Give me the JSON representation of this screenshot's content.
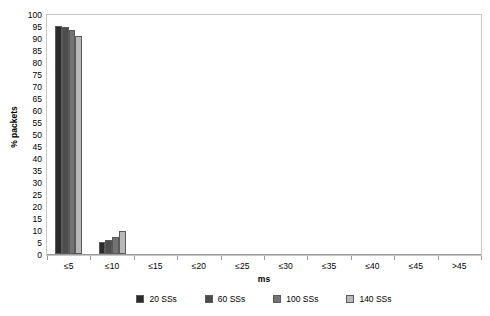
{
  "chart_data": {
    "type": "bar",
    "title": "",
    "xlabel": "ms",
    "ylabel": "% packets",
    "ylim": [
      0,
      100
    ],
    "ytick_step": 5,
    "yticks": [
      100,
      95,
      90,
      85,
      80,
      75,
      70,
      65,
      60,
      55,
      50,
      45,
      40,
      35,
      30,
      25,
      20,
      15,
      10,
      5,
      0
    ],
    "categories": [
      "≤5",
      "≤10",
      "≤15",
      "≤20",
      "≤25",
      "≤30",
      "≤35",
      "≤40",
      "≤45",
      ">45"
    ],
    "grid": false,
    "legend_position": "bottom",
    "series": [
      {
        "name": "20 SSs",
        "color": "#2b2b2b",
        "values": [
          95.0,
          5.0,
          0,
          0,
          0,
          0,
          0,
          0,
          0,
          0
        ]
      },
      {
        "name": "60 SSs",
        "color": "#4d4d4d",
        "values": [
          94.5,
          6.0,
          0,
          0,
          0,
          0,
          0,
          0,
          0,
          0
        ]
      },
      {
        "name": "100 SSs",
        "color": "#737373",
        "values": [
          93.5,
          7.0,
          0,
          0,
          0,
          0,
          0,
          0,
          0,
          0
        ]
      },
      {
        "name": "140 SSs",
        "color": "#b8b8b8",
        "values": [
          91.0,
          9.5,
          0,
          0,
          0,
          0,
          0,
          0,
          0,
          0
        ]
      }
    ]
  }
}
